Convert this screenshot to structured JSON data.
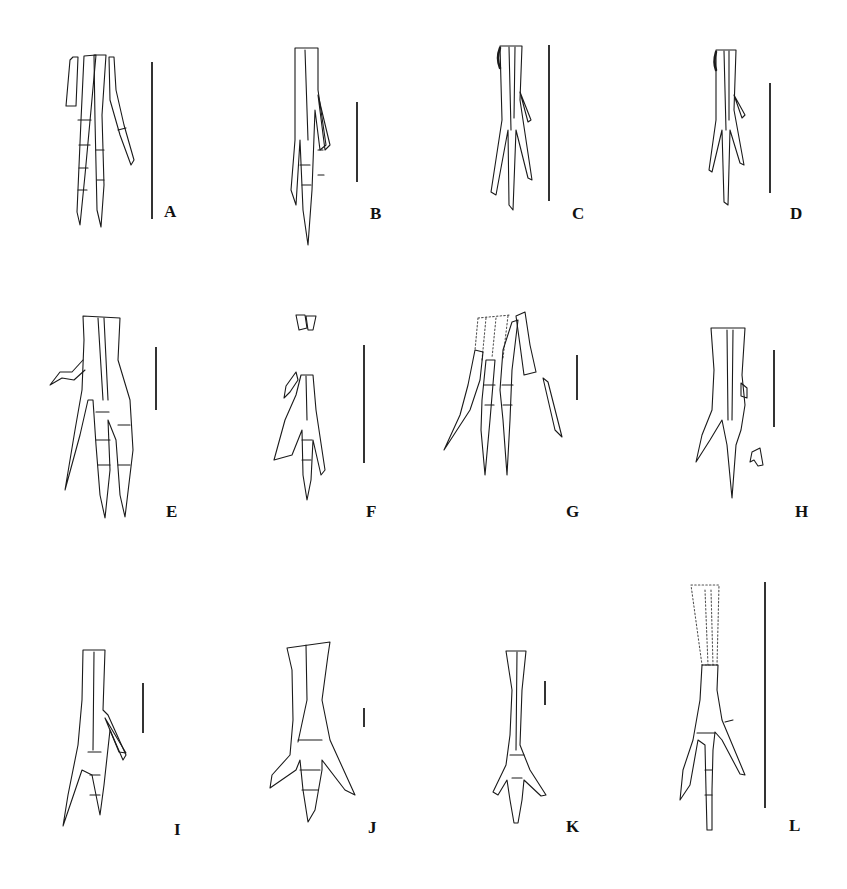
{
  "figure": {
    "type": "multi-panel scientific illustration",
    "panel_count": 12,
    "panels": [
      {
        "label": "A",
        "row": 1,
        "col": 1,
        "digits_visible": 4,
        "scale_bar": {
          "x": 151,
          "y1": 62,
          "y2": 219
        }
      },
      {
        "label": "B",
        "row": 1,
        "col": 2,
        "digits_visible": 4,
        "scale_bar": {
          "x": 356,
          "y1": 102,
          "y2": 182
        }
      },
      {
        "label": "C",
        "row": 1,
        "col": 3,
        "digits_visible": 4,
        "scale_bar": {
          "x": 548,
          "y1": 45,
          "y2": 201
        }
      },
      {
        "label": "D",
        "row": 1,
        "col": 4,
        "digits_visible": 4,
        "scale_bar": {
          "x": 769,
          "y1": 83,
          "y2": 193
        }
      },
      {
        "label": "E",
        "row": 2,
        "col": 1,
        "digits_visible": 4,
        "scale_bar": {
          "x": 155,
          "y1": 347,
          "y2": 410
        }
      },
      {
        "label": "F",
        "row": 2,
        "col": 2,
        "digits_visible": 3,
        "scale_bar": {
          "x": 363,
          "y1": 345,
          "y2": 463
        }
      },
      {
        "label": "G",
        "row": 2,
        "col": 3,
        "digits_visible": 4,
        "scale_bar": {
          "x": 576,
          "y1": 355,
          "y2": 400
        }
      },
      {
        "label": "H",
        "row": 2,
        "col": 4,
        "digits_visible": 3,
        "scale_bar": {
          "x": 773,
          "y1": 350,
          "y2": 427
        }
      },
      {
        "label": "I",
        "row": 3,
        "col": 1,
        "digits_visible": 4,
        "scale_bar": {
          "x": 142,
          "y1": 683,
          "y2": 733
        }
      },
      {
        "label": "J",
        "row": 3,
        "col": 2,
        "digits_visible": 4,
        "scale_bar": {
          "x": 363,
          "y1": 708,
          "y2": 727
        }
      },
      {
        "label": "K",
        "row": 3,
        "col": 3,
        "digits_visible": 4,
        "scale_bar": {
          "x": 544,
          "y1": 681,
          "y2": 705
        }
      },
      {
        "label": "L",
        "row": 3,
        "col": 4,
        "digits_visible": 4,
        "scale_bar": {
          "x": 764,
          "y1": 582,
          "y2": 808
        }
      }
    ],
    "colors": {
      "background": "#ffffff",
      "ink": "#1a1a1a"
    }
  }
}
